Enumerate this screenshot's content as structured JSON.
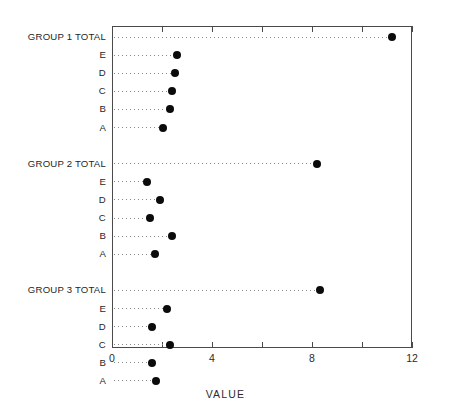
{
  "top_title": "",
  "axis": {
    "title": "VALUE",
    "tick_labels": [
      "0",
      "4",
      "8",
      "12"
    ],
    "major_ticks": [
      0,
      4,
      8,
      12
    ],
    "minor_ticks": [
      2,
      6,
      10
    ],
    "xmin": 0,
    "xmax": 12
  },
  "chart_data": {
    "type": "scatter",
    "title": "",
    "xlabel": "VALUE",
    "ylabel": "",
    "xlim": [
      0,
      12
    ],
    "grid": false,
    "legend": "none",
    "style": "dot-plot-with-dotted-leaders",
    "marker": "filled-circle",
    "marker_color": "#0b0b0b",
    "categories": [
      "GROUP 1 TOTAL",
      "E",
      "D",
      "C",
      "B",
      "A",
      "GROUP 2 TOTAL",
      "E",
      "D",
      "C",
      "B",
      "A",
      "GROUP 3 TOTAL",
      "E",
      "D",
      "C",
      "B",
      "A"
    ],
    "values": [
      11.2,
      2.6,
      2.5,
      2.4,
      2.3,
      2.05,
      8.2,
      1.4,
      1.9,
      1.5,
      2.4,
      1.7,
      8.3,
      2.2,
      1.6,
      2.3,
      1.6,
      1.75
    ],
    "groups": [
      {
        "name": "GROUP 1",
        "total_label": "GROUP 1 TOTAL",
        "total_value": 11.2,
        "items": [
          {
            "label": "E",
            "value": 2.6
          },
          {
            "label": "D",
            "value": 2.5
          },
          {
            "label": "C",
            "value": 2.4
          },
          {
            "label": "B",
            "value": 2.3
          },
          {
            "label": "A",
            "value": 2.05
          }
        ]
      },
      {
        "name": "GROUP 2",
        "total_label": "GROUP 2 TOTAL",
        "total_value": 8.2,
        "items": [
          {
            "label": "E",
            "value": 1.4
          },
          {
            "label": "D",
            "value": 1.9
          },
          {
            "label": "C",
            "value": 1.5
          },
          {
            "label": "B",
            "value": 2.4
          },
          {
            "label": "A",
            "value": 1.7
          }
        ]
      },
      {
        "name": "GROUP 3",
        "total_label": "GROUP 3 TOTAL",
        "total_value": 8.3,
        "items": [
          {
            "label": "E",
            "value": 2.2
          },
          {
            "label": "D",
            "value": 1.6
          },
          {
            "label": "C",
            "value": 2.3
          },
          {
            "label": "B",
            "value": 1.6
          },
          {
            "label": "A",
            "value": 1.75
          }
        ]
      }
    ]
  }
}
